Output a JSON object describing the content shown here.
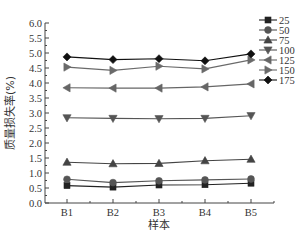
{
  "chart_data": {
    "type": "line",
    "title": "",
    "xlabel": "样本",
    "ylabel": "质量损失率(%)",
    "categories": [
      "B1",
      "B2",
      "B3",
      "B4",
      "B5"
    ],
    "ylim": [
      0.0,
      6.0
    ],
    "yticks": [
      "0.0",
      "0.5",
      "1.0",
      "1.5",
      "2.0",
      "2.5",
      "3.0",
      "3.5",
      "4.0",
      "4.5",
      "5.0",
      "5.5",
      "6.0"
    ],
    "grid": false,
    "legend_position": "top-right",
    "series": [
      {
        "name": "25",
        "marker": "square",
        "color": "#222222",
        "values": [
          0.58,
          0.53,
          0.6,
          0.61,
          0.66
        ]
      },
      {
        "name": "50",
        "marker": "circle",
        "color": "#555555",
        "values": [
          0.79,
          0.68,
          0.74,
          0.77,
          0.8
        ]
      },
      {
        "name": "75",
        "marker": "triangle-up",
        "color": "#444444",
        "values": [
          1.36,
          1.31,
          1.32,
          1.41,
          1.46
        ]
      },
      {
        "name": "100",
        "marker": "triangle-down",
        "color": "#555555",
        "values": [
          2.84,
          2.82,
          2.81,
          2.82,
          2.91
        ]
      },
      {
        "name": "125",
        "marker": "triangle-left",
        "color": "#666666",
        "values": [
          3.84,
          3.83,
          3.83,
          3.87,
          3.97
        ]
      },
      {
        "name": "150",
        "marker": "triangle-right",
        "color": "#6a6a6a",
        "values": [
          4.53,
          4.42,
          4.56,
          4.47,
          4.77
        ]
      },
      {
        "name": "175",
        "marker": "diamond",
        "color": "#111111",
        "values": [
          4.87,
          4.78,
          4.81,
          4.74,
          4.97
        ]
      }
    ]
  }
}
